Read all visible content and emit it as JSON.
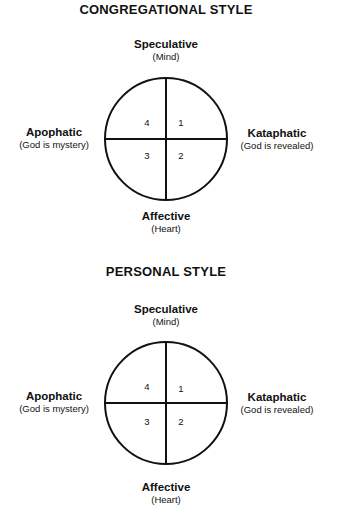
{
  "diagrams": [
    {
      "title": "CONGREGATIONAL STYLE",
      "top": {
        "label": "Speculative",
        "sub": "(Mind)"
      },
      "bottom": {
        "label": "Affective",
        "sub": "(Heart)"
      },
      "left": {
        "label": "Apophatic",
        "sub": "(God is mystery)"
      },
      "right": {
        "label": "Kataphatic",
        "sub": "(God is revealed)"
      },
      "quadrants": {
        "top_left": "4",
        "top_right": "1",
        "bottom_left": "3",
        "bottom_right": "2"
      }
    },
    {
      "title": "PERSONAL STYLE",
      "top": {
        "label": "Speculative",
        "sub": "(Mind)"
      },
      "bottom": {
        "label": "Affective",
        "sub": "(Heart)"
      },
      "left": {
        "label": "Apophatic",
        "sub": "(God is mystery)"
      },
      "right": {
        "label": "Kataphatic",
        "sub": "(God is revealed)"
      },
      "quadrants": {
        "top_left": "4",
        "top_right": "1",
        "bottom_left": "3",
        "bottom_right": "2"
      }
    }
  ],
  "colors": {
    "line": "#111111",
    "background": "#ffffff"
  }
}
